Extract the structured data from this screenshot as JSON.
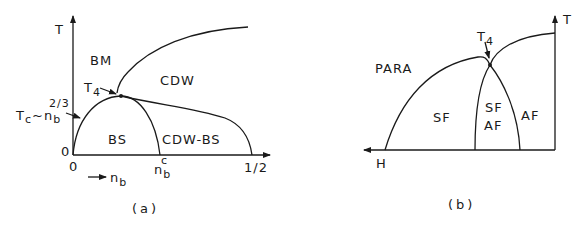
{
  "panel_a": {
    "y_axis_label": "T",
    "x_axis_origin_label": "0",
    "y_axis_origin_label": "0",
    "x_axis_label_arrow": "→",
    "x_axis_label": "n",
    "x_axis_label_sub": "b",
    "critical_density_label": "n",
    "critical_density_sub": "b",
    "critical_density_sup": "c",
    "x_end_label": "1/2",
    "region_bm": "BM",
    "region_cdw": "CDW",
    "region_bs": "BS",
    "region_cdw_bs": "CDW-BS",
    "tetracritical_label": "T",
    "tetracritical_sub": "4",
    "tc_label": "T",
    "tc_sub": "c",
    "tc_tilde": "~",
    "tc_n": "n",
    "tc_n_sub": "b",
    "tc_exp": "2/3",
    "caption": "(a)"
  },
  "panel_b": {
    "y_axis_label": "T",
    "x_axis_label": "H",
    "region_para": "PARA",
    "region_sf": "SF",
    "region_sf_af_top": "SF",
    "region_sf_af_bottom": "AF",
    "region_af": "AF",
    "tetracritical_label": "T",
    "tetracritical_sub": "4",
    "caption": "(b)"
  },
  "colors": {
    "ink": "#1a1a1a",
    "background": "#ffffff"
  }
}
